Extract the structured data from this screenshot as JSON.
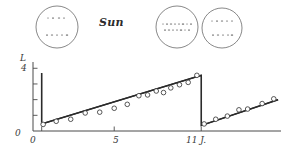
{
  "figure": {
    "title_text": "Sun",
    "caption_present": false
  },
  "sun_disks": [
    {
      "name": "sun-disk-cycle-start",
      "cx": 57,
      "cy": 27,
      "r": 21,
      "spot_bands": [
        {
          "latitude": "high-north",
          "y_offset": -9,
          "spots": [
            -9,
            -4,
            2,
            7
          ]
        },
        {
          "latitude": "high-south",
          "y_offset": 8,
          "spots": [
            -10,
            -5,
            0,
            5,
            10
          ]
        }
      ]
    },
    {
      "name": "sun-disk-cycle-maximum",
      "cx": 177,
      "cy": 27,
      "r": 21,
      "spot_bands": [
        {
          "latitude": "equator-upper",
          "y_offset": -3,
          "spots": [
            -14,
            -10,
            -6,
            -2,
            2,
            6,
            10,
            14
          ]
        },
        {
          "latitude": "equator-lower",
          "y_offset": 3,
          "spots": [
            -12,
            -8,
            -4,
            0,
            4,
            8,
            12
          ]
        }
      ]
    },
    {
      "name": "sun-disk-cycle-decline",
      "cx": 222,
      "cy": 28,
      "r": 20,
      "spot_bands": [
        {
          "latitude": "mid-north",
          "y_offset": -7,
          "spots": [
            -10,
            -5,
            0,
            5,
            10
          ]
        },
        {
          "latitude": "mid-south",
          "y_offset": 7,
          "spots": [
            -9,
            -4,
            1,
            6,
            10
          ]
        }
      ]
    }
  ],
  "chart_data": {
    "type": "line",
    "title": "",
    "xlabel": "11 J.",
    "ylabel": "L",
    "xlim": [
      -0.6,
      16.5
    ],
    "ylim": [
      0,
      4.4
    ],
    "grid": false,
    "legend_position": "none",
    "y_axis": {
      "origin_label": "0",
      "top_label": "4",
      "ticks": [
        1,
        2,
        3,
        4
      ]
    },
    "x_axis": {
      "tick_labels": [
        "0",
        "5",
        "11 J."
      ],
      "tick_values": [
        0,
        5,
        11
      ],
      "minor_tick_values": [
        0,
        5,
        11
      ]
    },
    "series": [
      {
        "name": "sawtooth-envelope",
        "type": "line",
        "points": [
          [
            0.0,
            3.7
          ],
          [
            0.0,
            0.45
          ],
          [
            11.0,
            3.55
          ],
          [
            11.0,
            0.35
          ],
          [
            16.3,
            2.0
          ]
        ]
      },
      {
        "name": "regression-trend-cycle-1",
        "type": "line",
        "points": [
          [
            0.0,
            0.45
          ],
          [
            11.0,
            3.55
          ]
        ]
      },
      {
        "name": "regression-trend-cycle-2",
        "type": "line",
        "points": [
          [
            11.0,
            0.35
          ],
          [
            16.3,
            2.0
          ]
        ]
      }
    ],
    "scatter_points": {
      "name": "observed-sunspot-counts",
      "marker": "open-circle",
      "x": [
        0.1,
        1.0,
        2.0,
        3.0,
        4.0,
        5.0,
        5.9,
        6.7,
        7.3,
        7.9,
        8.4,
        8.9,
        9.5,
        10.1,
        10.7,
        11.2,
        12.0,
        12.8,
        13.6,
        14.2,
        15.2,
        16.0
      ],
      "y": [
        0.42,
        0.62,
        0.75,
        1.15,
        1.2,
        1.45,
        1.7,
        2.25,
        2.3,
        2.55,
        2.45,
        2.75,
        2.95,
        3.1,
        3.55,
        0.45,
        0.75,
        0.95,
        1.35,
        1.4,
        1.75,
        2.05
      ]
    }
  },
  "colors": {
    "ink": "#2b2b2b",
    "axis": "#4a4a4a",
    "marker_stroke": "#3a3a3a",
    "background": "#ffffff"
  }
}
